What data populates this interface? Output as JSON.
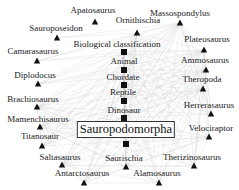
{
  "diagram": {
    "title": "Sauropodomorpha",
    "colors": {
      "edge": "#b8b8b8",
      "node": "#111111",
      "background": "#ffffff"
    },
    "center": {
      "label": "Sauropodomorpha",
      "x": 126,
      "y": 121,
      "marker": {
        "shape": "square",
        "x": 126,
        "y": 144
      }
    },
    "nodes": [
      {
        "id": "apatosaurus",
        "label": "Apatosaurus",
        "shape": "triangle",
        "lx": 93,
        "ly": 5,
        "x": 95,
        "y": 22
      },
      {
        "id": "ornithischia",
        "label": "Ornithischia",
        "shape": "triangle",
        "lx": 138,
        "ly": 15,
        "x": 137,
        "y": 33
      },
      {
        "id": "massospondylus",
        "label": "Massospondylus",
        "shape": "triangle",
        "lx": 180,
        "ly": 8,
        "x": 180,
        "y": 23
      },
      {
        "id": "sauroposeidon",
        "label": "Sauroposeidon",
        "shape": "triangle",
        "lx": 56,
        "ly": 23,
        "x": 57,
        "y": 38
      },
      {
        "id": "biological-classification",
        "label": "Biological classification",
        "shape": "square",
        "lx": 117,
        "ly": 39,
        "x": 124,
        "y": 52
      },
      {
        "id": "plateosaurus",
        "label": "Plateosaurus",
        "shape": "triangle",
        "lx": 207,
        "ly": 34,
        "x": 204,
        "y": 50
      },
      {
        "id": "camarasaurus",
        "label": "Camarasaurus",
        "shape": "triangle",
        "lx": 33,
        "ly": 46,
        "x": 37,
        "y": 61
      },
      {
        "id": "animal",
        "label": "Animal",
        "shape": "square",
        "lx": 124,
        "ly": 56,
        "x": 124,
        "y": 70
      },
      {
        "id": "ammosaurus",
        "label": "Ammosaurus",
        "shape": "triangle",
        "lx": 205,
        "ly": 55,
        "x": 206,
        "y": 70
      },
      {
        "id": "diplodocus",
        "label": "Diplodocus",
        "shape": "triangle",
        "lx": 35,
        "ly": 70,
        "x": 38,
        "y": 84
      },
      {
        "id": "chordate",
        "label": "Chordate",
        "shape": "square",
        "lx": 123,
        "ly": 72,
        "x": 124,
        "y": 85
      },
      {
        "id": "theropoda",
        "label": "Theropoda",
        "shape": "triangle",
        "lx": 202,
        "ly": 74,
        "x": 203,
        "y": 89
      },
      {
        "id": "reptile",
        "label": "Reptile",
        "shape": "square",
        "lx": 123,
        "ly": 87,
        "x": 124,
        "y": 101
      },
      {
        "id": "brachiosaurus",
        "label": "Brachiosaurus",
        "shape": "triangle",
        "lx": 33,
        "ly": 94,
        "x": 37,
        "y": 107
      },
      {
        "id": "dinosaur",
        "label": "Dinosaur",
        "shape": "square",
        "lx": 124,
        "ly": 105,
        "x": 124,
        "y": 118
      },
      {
        "id": "herrerasaurus",
        "label": "Herrerasaurus",
        "shape": "triangle",
        "lx": 209,
        "ly": 100,
        "x": 211,
        "y": 114
      },
      {
        "id": "mamenchisaurus",
        "label": "Mamenchisaurus",
        "shape": "triangle",
        "lx": 38,
        "ly": 114,
        "x": 40,
        "y": 127
      },
      {
        "id": "velociraptor",
        "label": "Velociraptor",
        "shape": "triangle",
        "lx": 211,
        "ly": 123,
        "x": 209,
        "y": 137
      },
      {
        "id": "titanosaur",
        "label": "Titanosaur",
        "shape": "triangle",
        "lx": 40,
        "ly": 131,
        "x": 42,
        "y": 146
      },
      {
        "id": "saltasaurus",
        "label": "Saltasaurus",
        "shape": "triangle",
        "lx": 60,
        "ly": 152,
        "x": 62,
        "y": 165
      },
      {
        "id": "saurischia",
        "label": "Saurischia",
        "shape": "triangle",
        "lx": 124,
        "ly": 153,
        "x": 126,
        "y": 167
      },
      {
        "id": "therizinosaurus",
        "label": "Therizinosaurus",
        "shape": "triangle",
        "lx": 192,
        "ly": 152,
        "x": 194,
        "y": 166
      },
      {
        "id": "antarctosaurus",
        "label": "Antarctosaurus",
        "shape": "triangle",
        "lx": 82,
        "ly": 168,
        "x": 84,
        "y": 183
      },
      {
        "id": "alamosaurus",
        "label": "Alamosaurus",
        "shape": "triangle",
        "lx": 157,
        "ly": 168,
        "x": 159,
        "y": 183
      }
    ]
  }
}
